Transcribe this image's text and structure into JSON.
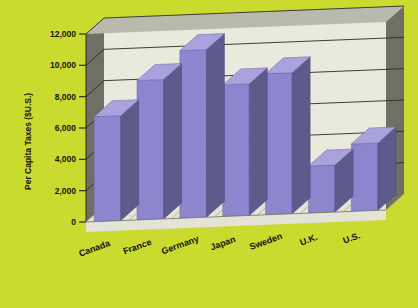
{
  "chart_data": {
    "type": "bar",
    "title": "",
    "subtitle": "",
    "xlabel": "",
    "ylabel": "Per Capita Taxes ($U.S.)",
    "categories": [
      "Canada",
      "France",
      "Germany",
      "Japan",
      "Sweden",
      "U.K.",
      "U.S."
    ],
    "values": [
      6700,
      8900,
      10700,
      8400,
      9000,
      3000,
      4300
    ],
    "series": [
      {
        "name": "Per Capita Taxes",
        "values": [
          6700,
          8900,
          10700,
          8400,
          9000,
          3000,
          4300
        ]
      }
    ],
    "ylim": [
      0,
      12000
    ],
    "ytick_values": [
      0,
      2000,
      4000,
      6000,
      8000,
      10000,
      12000
    ],
    "ytick_labels": [
      "0",
      "2,000",
      "4,000",
      "6,000",
      "8,000",
      "10,000",
      "12,000"
    ],
    "grid": true,
    "grid_axis": "y",
    "legend": false,
    "legend_position": "none",
    "projection": "3d",
    "annotations": [],
    "label_rotation_deg": -20
  },
  "style": {
    "background_color": "#c8db2e",
    "bar_front_color": "#8d86cf",
    "bar_side_color": "#5d5a8c",
    "bar_top_color": "#a9a2dd",
    "wall_back_color": "#e9e9dd",
    "wall_side_color": "#6f6f63",
    "floor_color": "#e4e4d6",
    "edge_color": "#9a9a90",
    "text_color": "#14140c",
    "frame_color": "#b9b9ad"
  },
  "axis": {
    "y_title": "Per Capita Taxes ($U.S.)",
    "ticks": [
      "12,000",
      "10,000",
      "8,000",
      "6,000",
      "4,000",
      "2,000",
      "0"
    ]
  },
  "categories": [
    {
      "label": "Canada",
      "value": 6700
    },
    {
      "label": "France",
      "value": 8900
    },
    {
      "label": "Germany",
      "value": 10700
    },
    {
      "label": "Japan",
      "value": 8400
    },
    {
      "label": "Sweden",
      "value": 9000
    },
    {
      "label": "U.K.",
      "value": 3000
    },
    {
      "label": "U.S.",
      "value": 4300
    }
  ]
}
